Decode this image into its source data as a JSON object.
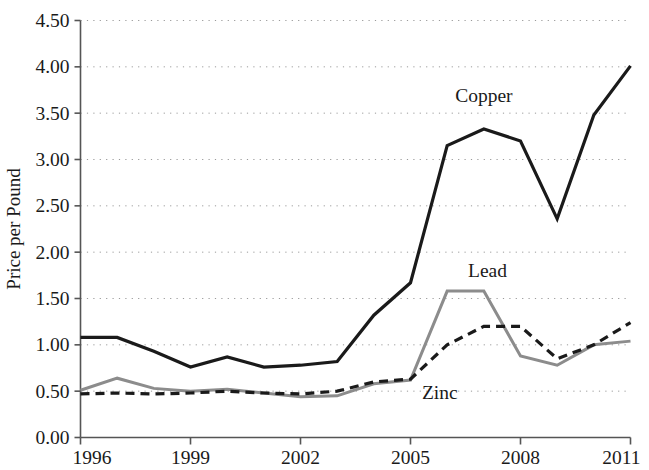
{
  "chart_data": {
    "type": "line",
    "title": "",
    "subtitle": "",
    "xlabel": "",
    "ylabel": "Price per Pound",
    "x": [
      1996,
      1997,
      1998,
      1999,
      2000,
      2001,
      2002,
      2003,
      2004,
      2005,
      2006,
      2007,
      2008,
      2009,
      2010,
      2011
    ],
    "xlim": [
      1996,
      2011
    ],
    "ylim": [
      0.0,
      4.5
    ],
    "ytick_step": 0.5,
    "xtick_values": [
      1996,
      1999,
      2002,
      2005,
      2008,
      2011
    ],
    "xtick_labels": [
      "1996",
      "1999",
      "2002",
      "2005",
      "2008",
      "2011"
    ],
    "ytick_values": [
      0.0,
      0.5,
      1.0,
      1.5,
      2.0,
      2.5,
      3.0,
      3.5,
      4.0,
      4.5
    ],
    "ytick_labels": [
      "0.00",
      "0.50",
      "1.00",
      "1.50",
      "2.00",
      "2.50",
      "3.00",
      "3.50",
      "4.00",
      "4.50"
    ],
    "grid": true,
    "grid_axis": "y",
    "grid_style": "dotted",
    "legend_position": "inline-annotations",
    "series": [
      {
        "name": "Copper",
        "color": "#1a1a1a",
        "style": "solid",
        "width": 3.2,
        "label_x": 2007.0,
        "label_y": 3.62,
        "values": [
          1.08,
          1.08,
          0.93,
          0.76,
          0.87,
          0.76,
          0.78,
          0.82,
          1.32,
          1.67,
          3.15,
          3.33,
          3.2,
          2.36,
          3.48,
          4.01
        ]
      },
      {
        "name": "Lead",
        "color": "#8c8c8c",
        "style": "solid",
        "width": 3.0,
        "label_x": 2007.1,
        "label_y": 1.73,
        "values": [
          0.51,
          0.64,
          0.53,
          0.5,
          0.52,
          0.48,
          0.44,
          0.45,
          0.58,
          0.62,
          1.58,
          1.58,
          0.88,
          0.78,
          1.0,
          1.04
        ]
      },
      {
        "name": "Zinc",
        "color": "#1a1a1a",
        "style": "dashed",
        "width": 3.2,
        "label_x": 2005.8,
        "label_y": 0.42,
        "values": [
          0.47,
          0.48,
          0.47,
          0.48,
          0.5,
          0.48,
          0.47,
          0.5,
          0.6,
          0.63,
          1.0,
          1.2,
          1.2,
          0.85,
          1.0,
          1.24
        ]
      }
    ],
    "annotations": [
      {
        "text": "Copper",
        "x": 2007.0,
        "y": 3.62
      },
      {
        "text": "Lead",
        "x": 2007.1,
        "y": 1.73
      },
      {
        "text": "Zinc",
        "x": 2005.8,
        "y": 0.42
      }
    ],
    "axis_color": "#555555"
  }
}
